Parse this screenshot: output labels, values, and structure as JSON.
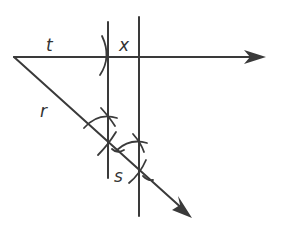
{
  "diagram": {
    "type": "geometric-construction",
    "labels": {
      "t": "t",
      "x": "x",
      "r": "r",
      "s": "s"
    },
    "colors": {
      "stroke": "#3a3a3a",
      "background": "#ffffff"
    },
    "elements": [
      {
        "name": "horizontal-ray",
        "label": "t / x",
        "from": [
          14,
          57
        ],
        "to": [
          265,
          57
        ]
      },
      {
        "name": "diagonal-ray",
        "label": "r / s",
        "from": [
          14,
          57
        ],
        "to": [
          192,
          218
        ]
      },
      {
        "name": "vertical-line-1",
        "x": 108,
        "from_y": 22,
        "to_y": 178
      },
      {
        "name": "vertical-line-2",
        "x": 139,
        "from_y": 17,
        "to_y": 216
      }
    ]
  }
}
